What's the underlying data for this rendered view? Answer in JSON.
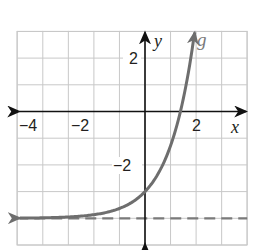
{
  "chart_data": {
    "type": "line",
    "title": "",
    "xlabel": "x",
    "ylabel": "y",
    "xlim": [
      -5,
      4
    ],
    "ylim": [
      -5,
      3
    ],
    "grid": true,
    "grid_step": 1,
    "x_ticks": [
      {
        "value": -4,
        "label": "−4"
      },
      {
        "value": -2,
        "label": "−2"
      },
      {
        "value": 2,
        "label": "2"
      }
    ],
    "y_ticks": [
      {
        "value": 2,
        "label": "2"
      },
      {
        "value": -2,
        "label": "−2"
      }
    ],
    "series": [
      {
        "name": "g",
        "style": "solid",
        "color": "#6e6e6e",
        "description": "exponential growth curve approaching horizontal asymptote y = -4 on the left, passing through (0, -3)",
        "approx_function": "e^x - 4",
        "points": [
          {
            "x": -5,
            "y": -3.99
          },
          {
            "x": -4,
            "y": -3.98
          },
          {
            "x": -3,
            "y": -3.95
          },
          {
            "x": -2,
            "y": -3.86
          },
          {
            "x": -1,
            "y": -3.63
          },
          {
            "x": 0,
            "y": -3.0
          },
          {
            "x": 0.5,
            "y": -2.35
          },
          {
            "x": 1,
            "y": -1.28
          },
          {
            "x": 1.39,
            "y": 0.0
          },
          {
            "x": 1.7,
            "y": 1.47
          },
          {
            "x": 1.95,
            "y": 3.0
          }
        ],
        "arrows": [
          "left",
          "top"
        ]
      },
      {
        "name": "asymptote",
        "style": "dashed",
        "color": "#7a7a7a",
        "equation": "y = -4",
        "points": [
          {
            "x": -5,
            "y": -4
          },
          {
            "x": 4,
            "y": -4
          }
        ]
      }
    ],
    "annotations": [
      {
        "text": "g",
        "x": 2.1,
        "y": 2.6,
        "color": "#7a7a7a"
      }
    ]
  },
  "labels": {
    "x_axis": "x",
    "y_axis": "y",
    "curve": "g",
    "x_tick_neg4": "−4",
    "x_tick_neg2": "−2",
    "x_tick_2": "2",
    "y_tick_2": "2",
    "y_tick_neg2": "−2"
  },
  "colors": {
    "grid": "#c8c8c8",
    "axes": "#111111",
    "curve": "#6e6e6e",
    "asymptote": "#7a7a7a"
  }
}
